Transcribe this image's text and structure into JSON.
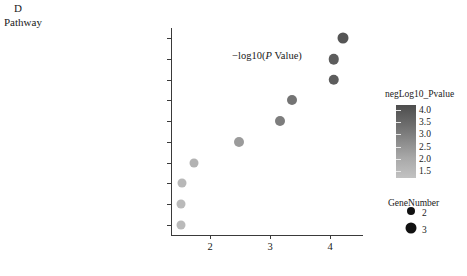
{
  "panel": {
    "letter": "D",
    "y_axis_title": "Pathway"
  },
  "axis": {
    "x_title_prefix": "−log10(",
    "x_title_italic": "P",
    "x_title_suffix": " Value)",
    "x_ticks": [
      "2",
      "3",
      "4"
    ]
  },
  "color_legend": {
    "title": "negLog10_Pvalue",
    "ticks": [
      "4.0",
      "3.5",
      "3.0",
      "2.5",
      "2.0",
      "1.5"
    ],
    "low_color": "#c2c2c2",
    "high_color": "#4d4d4d"
  },
  "size_legend": {
    "title": "GeneNumber",
    "items": [
      {
        "label": "2",
        "diameter": 8
      },
      {
        "label": "3",
        "diameter": 11
      }
    ]
  },
  "chart_data": {
    "type": "scatter",
    "title": "D",
    "xlabel": "−log10(P Value)",
    "ylabel": "Pathway",
    "xlim": [
      1.35,
      4.55
    ],
    "grid": false,
    "legend_position": "right",
    "color_scale": {
      "name": "negLog10_Pvalue",
      "min": 1.5,
      "max": 4.0
    },
    "size_scale": {
      "name": "GeneNumber",
      "values": [
        2,
        3
      ]
    },
    "categories": [
      "Amyotrophic lateral sclerosis (ALS)",
      "Colorectal cancer",
      "Apoptosis",
      "Hepatitis B",
      "Tuberculosis",
      "Pathways in cancer",
      "p53 signaling pathway",
      "Toxoplasmosis",
      "Sphingolipid signaling pathway",
      "Neurotrophin signaling pathway"
    ],
    "points": [
      {
        "category": "Amyotrophic lateral sclerosis (ALS)",
        "x": 4.22,
        "negLog10_Pvalue": 4.22,
        "GeneNumber": 3,
        "color": "#555555",
        "diameter": 11
      },
      {
        "category": "Colorectal cancer",
        "x": 4.06,
        "negLog10_Pvalue": 4.06,
        "GeneNumber": 3,
        "color": "#5d5d5d",
        "diameter": 10.5
      },
      {
        "category": "Apoptosis",
        "x": 4.06,
        "negLog10_Pvalue": 4.06,
        "GeneNumber": 3,
        "color": "#5d5d5d",
        "diameter": 10.5
      },
      {
        "category": "Hepatitis B",
        "x": 3.36,
        "negLog10_Pvalue": 3.36,
        "GeneNumber": 3,
        "color": "#747474",
        "diameter": 10
      },
      {
        "category": "Tuberculosis",
        "x": 3.17,
        "negLog10_Pvalue": 3.17,
        "GeneNumber": 3,
        "color": "#7d7d7d",
        "diameter": 10
      },
      {
        "category": "Pathways in cancer",
        "x": 2.49,
        "negLog10_Pvalue": 2.49,
        "GeneNumber": 3,
        "color": "#9b9b9b",
        "diameter": 10
      },
      {
        "category": "p53 signaling pathway",
        "x": 1.73,
        "negLog10_Pvalue": 1.73,
        "GeneNumber": 2,
        "color": "#b2b2b2",
        "diameter": 9
      },
      {
        "category": "Toxoplasmosis",
        "x": 1.54,
        "negLog10_Pvalue": 1.54,
        "GeneNumber": 2,
        "color": "#b8b8b8",
        "diameter": 9
      },
      {
        "category": "Sphingolipid signaling pathway",
        "x": 1.51,
        "negLog10_Pvalue": 1.51,
        "GeneNumber": 2,
        "color": "#bababa",
        "diameter": 9
      },
      {
        "category": "Neurotrophin signaling pathway",
        "x": 1.51,
        "negLog10_Pvalue": 1.51,
        "GeneNumber": 2,
        "color": "#bababa",
        "diameter": 9
      }
    ]
  }
}
